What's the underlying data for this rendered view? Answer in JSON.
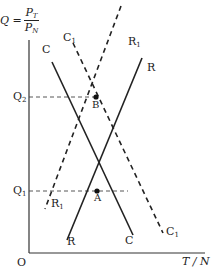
{
  "axes": {
    "y_label": {
      "lhs": "Q =",
      "numerator": "P",
      "numerator_sub": "T",
      "denominator": "P",
      "denominator_sub": "N"
    },
    "x_label": "T / N",
    "origin": "O",
    "ticks": [
      {
        "name": "Q",
        "sub": "2"
      },
      {
        "name": "Q",
        "sub": "1"
      }
    ]
  },
  "curves": {
    "C": {
      "label": "C",
      "style": "solid"
    },
    "R": {
      "label": "R",
      "style": "solid"
    },
    "C1": {
      "label": "C",
      "sub": "1",
      "style": "dashed"
    },
    "R1": {
      "label": "R",
      "sub": "1",
      "style": "dashed"
    }
  },
  "points": {
    "A": {
      "label": "A"
    },
    "B": {
      "label": "B"
    }
  },
  "colors": {
    "ink": "#222222",
    "background": "#ffffff"
  }
}
